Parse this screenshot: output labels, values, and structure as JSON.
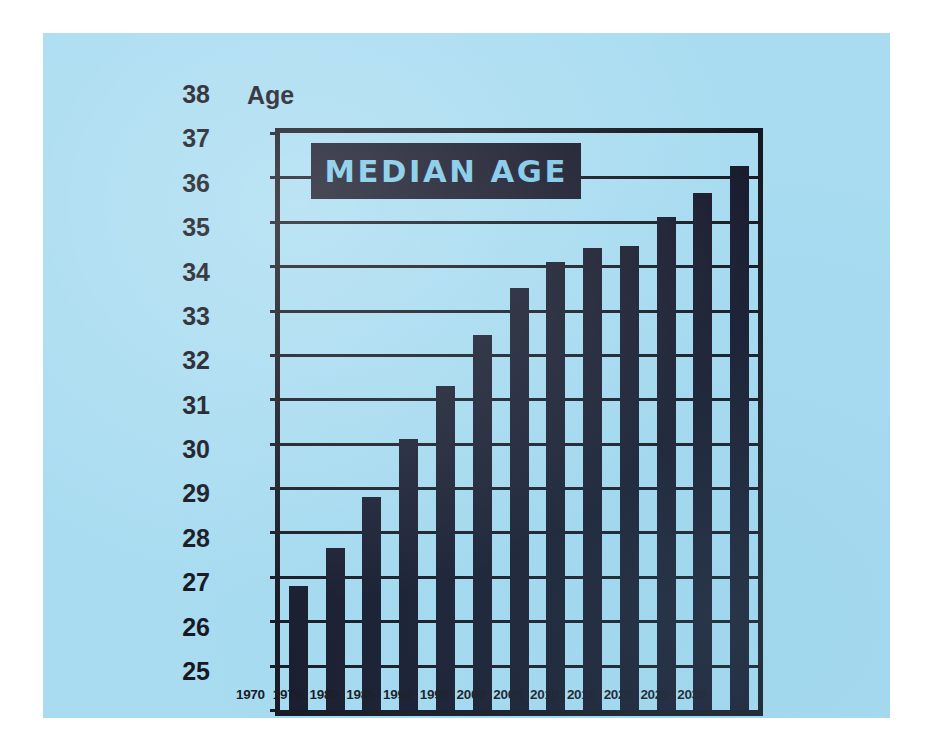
{
  "poster": {
    "background_color": "#a9dcf1",
    "ink_color": "#17182a",
    "banner_text_color": "#7dc8e8",
    "axis_caption": "Age",
    "banner_label": "MEDIAN AGE"
  },
  "chart_data": {
    "type": "bar",
    "title": "MEDIAN AGE",
    "xlabel": "",
    "ylabel": "Age",
    "ylim": [
      25,
      38
    ],
    "ytick_step": 1,
    "grid": true,
    "legend": "none",
    "categories": [
      "1970",
      "1975",
      "1980",
      "1985",
      "1990",
      "1995",
      "2000",
      "2005",
      "2010",
      "2015",
      "2020",
      "2025",
      "2030"
    ],
    "values": [
      27.8,
      28.65,
      29.8,
      31.1,
      32.3,
      33.45,
      34.5,
      35.1,
      35.4,
      35.45,
      36.1,
      36.65,
      37.25
    ],
    "ytick_labels": [
      "38",
      "37",
      "36",
      "35",
      "34",
      "33",
      "32",
      "31",
      "30",
      "29",
      "28",
      "27",
      "26",
      "25"
    ],
    "bar_color": "#17182a"
  }
}
